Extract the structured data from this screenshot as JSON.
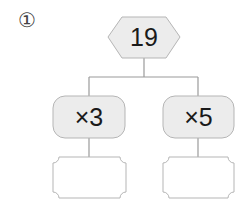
{
  "problem": {
    "number_label": "①",
    "root_value": "19",
    "branches": [
      {
        "operation": "×3",
        "answer": ""
      },
      {
        "operation": "×5",
        "answer": ""
      }
    ]
  },
  "colors": {
    "line": "#9a9a9a",
    "fill": "#ececec",
    "text": "#1a1a1a"
  }
}
